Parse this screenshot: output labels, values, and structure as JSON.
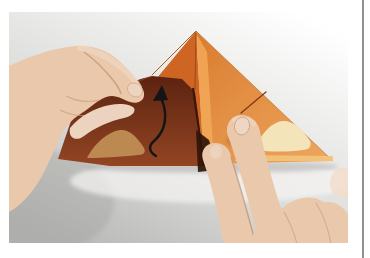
{
  "page": {
    "background_color": "#ffffff",
    "border_line_color": "#474747"
  },
  "photo": {
    "description": "Close-up photograph of an origami step: a left hand lifts the front flap of a folded orange paper triangle while two fingers of a right hand hold the right half down on a gray tabletop; a black curved arrow indicates folding the flap upward along the vertical center crease.",
    "background_top_color": "#ffffff",
    "background_bottom_color": "#b7b7b5"
  },
  "origami": {
    "paper_color_left_face": "#cf6522",
    "paper_color_right_face": "#da7c30",
    "paper_color_right_face_light": "#eda55c",
    "paper_color_base_strip": "#f3c47c",
    "inner_flap_dark_color": "#5c2310",
    "inner_flap_light_color": "#934523",
    "crease_highlight_color": "#f2a756",
    "crease_edge_dark_color": "#38160a",
    "diagonal_crease_color": "#7e3a12",
    "motif_light_color": "#f4e4ba",
    "motif_dark_color": "#bc8a50",
    "deep_shadow_color": "#30150a"
  },
  "annotation_arrow": {
    "meaning": "fold front flap upward",
    "color": "#151515"
  },
  "hands": {
    "skin_base_color": "#e9c8ab",
    "skin_light_color": "#f2dcc8",
    "skin_shadow_color": "#c89672",
    "nail_color": "#eed6c2"
  },
  "table": {
    "shadow_color": "#8d8d8b",
    "reflection_color": "#f6f5f3"
  }
}
